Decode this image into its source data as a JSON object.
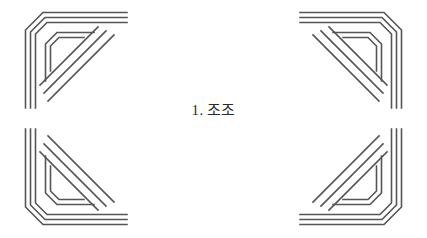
{
  "page": {
    "background_color": "#ffffff",
    "width": 427,
    "height": 238
  },
  "heading": {
    "number": "1.",
    "title": "조조",
    "full_text": "1. 조조",
    "color": "#2b2b2b"
  },
  "ornaments": {
    "line_color": "#555555",
    "items": [
      {
        "name": "top-left",
        "position": "top-left"
      },
      {
        "name": "top-right",
        "position": "top-right"
      },
      {
        "name": "bottom-left",
        "position": "bottom-left"
      },
      {
        "name": "bottom-right",
        "position": "bottom-right"
      }
    ]
  }
}
